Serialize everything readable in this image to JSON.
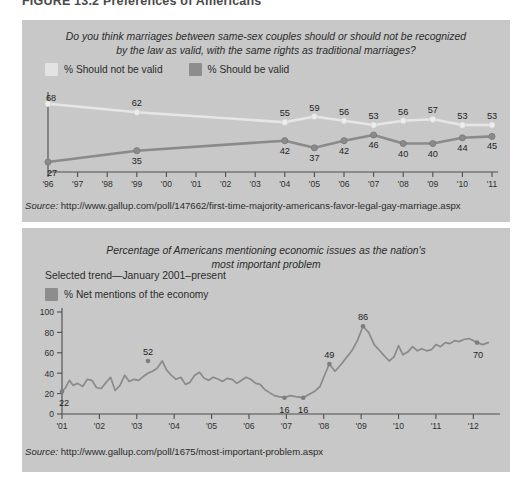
{
  "figure": {
    "title": "FIGURE 13.2 Preferences of Americans"
  },
  "colors": {
    "panel_background": "#c8c8c8",
    "series_light": "#e6e6e6",
    "series_dark": "#8a8a8a",
    "axis": "#4d4d4d",
    "text": "#2b2b2b"
  },
  "chart_top": {
    "question": "Do you think marriages between same-sex couples should or should not be recognized by the law as valid, with the same rights as traditional marriages?",
    "question_line1": "Do you think marriages between same-sex couples should or should not be recognized",
    "question_line2": "by the law as valid, with the same rights as traditional marriages?",
    "legend": [
      {
        "label": "% Should not be valid",
        "swatch": "light"
      },
      {
        "label": "% Should be valid",
        "swatch": "dark"
      }
    ],
    "source_label": "Source:",
    "source_url": "http://www.gallup.com/poll/147662/first-time-majority-americans-favor-legal-gay-marriage.aspx"
  },
  "chart_bottom": {
    "title_line1": "Percentage of Americans mentioning economic issues as the nation's",
    "title_line2": "most important problem",
    "subtitle": "Selected trend—January 2001–present",
    "legend": [
      {
        "label": "% Net mentions of the economy",
        "swatch": "dark"
      }
    ],
    "source_label": "Source:",
    "source_url": "http://www.gallup.com/poll/1675/most-important-problem.aspx"
  },
  "chart_data": [
    {
      "id": "same-sex-marriage",
      "type": "line",
      "title": "Do you think marriages between same-sex couples should or should not be recognized by the law as valid, with the same rights as traditional marriages?",
      "xlabel": "",
      "ylabel": "",
      "grid": false,
      "legend_position": "top-left",
      "axis_ticks": [
        "'96",
        "'97",
        "'98",
        "'99",
        "'00",
        "'01",
        "'02",
        "'03",
        "'04",
        "'05",
        "'06",
        "'07",
        "'08",
        "'09",
        "'10",
        "'11"
      ],
      "xlim": [
        1996,
        2011
      ],
      "ylim": [
        20,
        72
      ],
      "series": [
        {
          "name": "% Should not be valid",
          "color": "#e6e6e6",
          "x": [
            1996,
            1999,
            2004,
            2005,
            2006,
            2007,
            2008,
            2009,
            2010,
            2011
          ],
          "values": [
            68,
            62,
            55,
            59,
            56,
            53,
            56,
            57,
            53,
            53
          ],
          "labels": [
            68,
            62,
            55,
            59,
            56,
            53,
            56,
            57,
            53,
            53
          ]
        },
        {
          "name": "% Should be valid",
          "color": "#8a8a8a",
          "x": [
            1996,
            1999,
            2004,
            2005,
            2006,
            2007,
            2008,
            2009,
            2010,
            2011
          ],
          "values": [
            27,
            35,
            42,
            37,
            42,
            46,
            40,
            40,
            44,
            45
          ],
          "labels": [
            27,
            35,
            42,
            37,
            42,
            46,
            40,
            40,
            44,
            45
          ]
        }
      ]
    },
    {
      "id": "economy-most-important-problem",
      "type": "line",
      "title": "Percentage of Americans mentioning economic issues as the nation's most important problem",
      "subtitle": "Selected trend—January 2001–present",
      "xlabel": "",
      "ylabel": "",
      "grid": false,
      "legend_position": "top-left",
      "ylim": [
        0,
        100
      ],
      "ytick_labels": [
        "0",
        "20",
        "40",
        "60",
        "80",
        "100"
      ],
      "yticks": [
        0,
        20,
        40,
        60,
        80,
        100
      ],
      "axis_ticks": [
        "'01",
        "'02",
        "'03",
        "'04",
        "'05",
        "'06",
        "'07",
        "'08",
        "'09",
        "'10",
        "'11",
        "'12"
      ],
      "xlim": [
        2001,
        2012.5
      ],
      "annotations": [
        {
          "label": "22",
          "x": 2001.0,
          "y": 22
        },
        {
          "label": "52",
          "x": 2003.3,
          "y": 52
        },
        {
          "label": "16",
          "x": 2006.95,
          "y": 16
        },
        {
          "label": "16",
          "x": 2007.45,
          "y": 16
        },
        {
          "label": "49",
          "x": 2008.15,
          "y": 49
        },
        {
          "label": "86",
          "x": 2009.05,
          "y": 86
        },
        {
          "label": "70",
          "x": 2012.1,
          "y": 70
        }
      ],
      "series": [
        {
          "name": "% Net mentions of the economy",
          "color": "#8a8a8a",
          "x": [
            2001.0,
            2001.1,
            2001.2,
            2001.3,
            2001.42,
            2001.55,
            2001.68,
            2001.8,
            2001.92,
            2002.05,
            2002.18,
            2002.3,
            2002.42,
            2002.55,
            2002.68,
            2002.8,
            2002.92,
            2003.05,
            2003.18,
            2003.3,
            2003.42,
            2003.55,
            2003.68,
            2003.8,
            2003.92,
            2004.05,
            2004.18,
            2004.3,
            2004.42,
            2004.55,
            2004.68,
            2004.8,
            2004.92,
            2005.05,
            2005.18,
            2005.3,
            2005.42,
            2005.55,
            2005.68,
            2005.8,
            2005.92,
            2006.05,
            2006.18,
            2006.3,
            2006.42,
            2006.55,
            2006.68,
            2006.8,
            2006.95,
            2007.1,
            2007.25,
            2007.45,
            2007.6,
            2007.75,
            2007.9,
            2008.0,
            2008.15,
            2008.3,
            2008.45,
            2008.6,
            2008.75,
            2008.9,
            2009.05,
            2009.2,
            2009.35,
            2009.5,
            2009.62,
            2009.75,
            2009.88,
            2010.0,
            2010.12,
            2010.25,
            2010.38,
            2010.5,
            2010.62,
            2010.75,
            2010.88,
            2011.0,
            2011.12,
            2011.25,
            2011.38,
            2011.5,
            2011.62,
            2011.75,
            2011.88,
            2012.0,
            2012.1,
            2012.25,
            2012.4
          ],
          "values": [
            22,
            26,
            33,
            28,
            30,
            27,
            34,
            33,
            26,
            25,
            31,
            36,
            23,
            28,
            38,
            32,
            34,
            33,
            37,
            40,
            42,
            45,
            52,
            43,
            38,
            34,
            36,
            29,
            31,
            38,
            41,
            35,
            33,
            36,
            34,
            32,
            35,
            34,
            30,
            33,
            36,
            34,
            30,
            29,
            24,
            21,
            18,
            17,
            16,
            18,
            17,
            16,
            19,
            22,
            27,
            36,
            49,
            42,
            48,
            55,
            62,
            72,
            86,
            80,
            68,
            62,
            57,
            52,
            56,
            67,
            58,
            61,
            66,
            62,
            64,
            62,
            63,
            68,
            66,
            70,
            69,
            72,
            71,
            73,
            74,
            72,
            70,
            68,
            70
          ]
        }
      ]
    }
  ]
}
